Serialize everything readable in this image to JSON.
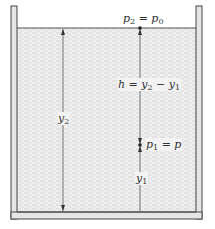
{
  "diagram": {
    "labels": {
      "surface_pressure": {
        "lhs": "p",
        "lhs_sub": "2",
        "eq": " = ",
        "rhs": "p",
        "rhs_sub": "0"
      },
      "depth": {
        "lhs": "h",
        "eq": " = ",
        "a": "y",
        "a_sub": "2",
        "minus": " − ",
        "b": "y",
        "b_sub": "1"
      },
      "total_height": {
        "var": "y",
        "sub": "2"
      },
      "point_pressure": {
        "lhs": "p",
        "lhs_sub": "1",
        "eq": " = ",
        "rhs": "p"
      },
      "point_height": {
        "var": "y",
        "sub": "1"
      }
    },
    "colors": {
      "wall_fill": "#e6e6e6",
      "wall_stroke": "#444444",
      "liquid": "#efefef",
      "liquid_dash": "#d0d0d0",
      "line": "#555555"
    }
  }
}
